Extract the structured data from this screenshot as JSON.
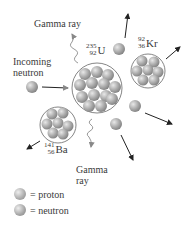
{
  "labels": {
    "gamma_ray_top": "Gamma ray",
    "incoming_neutron_line1": "Incoming",
    "incoming_neutron_line2": "neutron",
    "gamma_ray_bottom_line1": "Gamma",
    "gamma_ray_bottom_line2": "ray"
  },
  "isotopes": {
    "uranium": {
      "mass": "235",
      "atomic": "92",
      "symbol": "U"
    },
    "krypton": {
      "mass": "92",
      "atomic": "36",
      "symbol": "Kr"
    },
    "barium": {
      "mass": "141",
      "atomic": "56",
      "symbol": "Ba"
    }
  },
  "legend": [
    {
      "text": "= proton",
      "color": "#b8b8b8"
    },
    {
      "text": "= neutron",
      "color": "#a9a9a9"
    }
  ]
}
